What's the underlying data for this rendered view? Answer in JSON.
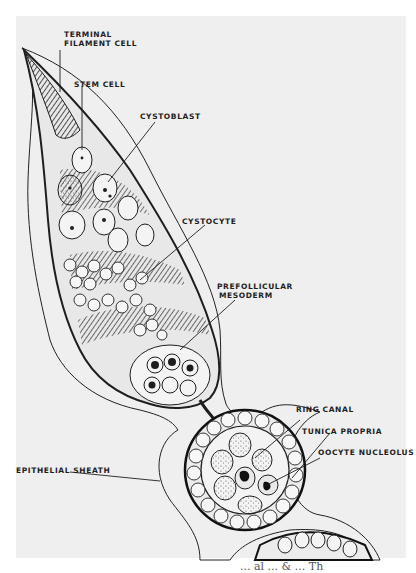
{
  "figure": {
    "background_color": "#efefef",
    "ink_color": "#1e1e1e",
    "labels": [
      {
        "id": "terminal-filament-cell",
        "line1": "TERMINAL",
        "line2": "FILAMENT CELL"
      },
      {
        "id": "stem-cell",
        "line1": "STEM CELL"
      },
      {
        "id": "cystoblast",
        "line1": "CYSTOBLAST"
      },
      {
        "id": "cystocyte",
        "line1": "CYSTOCYTE"
      },
      {
        "id": "prefollicular-mesoderm",
        "line1": "PREFOLLICULAR",
        "line2": "MESODERM"
      },
      {
        "id": "ring-canal",
        "line1": "RING CANAL"
      },
      {
        "id": "tunica-propria",
        "line1": "TUNICA PROPRIA"
      },
      {
        "id": "oocyte-nucleolus",
        "line1": "OOCYTE NUCLEOLUS"
      },
      {
        "id": "epithelial-sheath",
        "line1": "EPITHELIAL SHEATH"
      }
    ],
    "caption_fragment": "... al  ... & ... Th"
  }
}
